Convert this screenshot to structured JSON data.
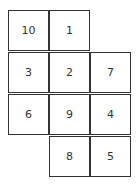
{
  "grid": {
    "cells": [
      {
        "row": 0,
        "col": 0,
        "value": "10"
      },
      {
        "row": 0,
        "col": 1,
        "value": "1"
      },
      {
        "row": 1,
        "col": 0,
        "value": "3"
      },
      {
        "row": 1,
        "col": 1,
        "value": "2"
      },
      {
        "row": 1,
        "col": 2,
        "value": "7"
      },
      {
        "row": 2,
        "col": 0,
        "value": "6"
      },
      {
        "row": 2,
        "col": 1,
        "value": "9"
      },
      {
        "row": 2,
        "col": 2,
        "value": "4"
      },
      {
        "row": 3,
        "col": 1,
        "value": "8"
      },
      {
        "row": 3,
        "col": 2,
        "value": "5"
      }
    ]
  }
}
